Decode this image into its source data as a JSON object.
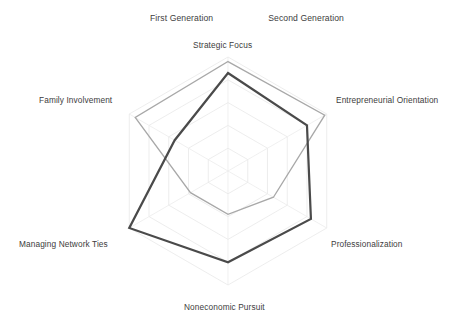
{
  "legend": {
    "position": "top-center",
    "items": [
      {
        "label": "First Generation",
        "color": "#a8a8a8",
        "width": 1.3
      },
      {
        "label": "Second Generation",
        "color": "#4a4a4a",
        "width": 2.2
      }
    ]
  },
  "axis_labels": {
    "strategic_focus": "Strategic Focus",
    "entrepreneurial_orientation": "Entrepreneurial Orientation",
    "professionalization": "Professionalization",
    "noneconomic_pursuit": "Noneconomic Pursuit",
    "managing_network_ties": "Managing Network Ties",
    "family_involvement": "Family Involvement"
  },
  "chart_data": {
    "type": "radar",
    "title": "",
    "xlabel": "",
    "ylabel": "",
    "categories": [
      "Strategic Focus",
      "Entrepreneurial Orientation",
      "Professionalization",
      "Noneconomic Pursuit",
      "Managing Network Ties",
      "Family Involvement"
    ],
    "series": [
      {
        "name": "First Generation",
        "color": "#a8a8a8",
        "line_width": 1.3,
        "values": [
          4.8,
          4.9,
          2.3,
          1.9,
          1.9,
          4.7
        ]
      },
      {
        "name": "Second Generation",
        "color": "#4a4a4a",
        "line_width": 2.2,
        "values": [
          4.3,
          4.0,
          4.2,
          4.0,
          5.0,
          2.7
        ]
      }
    ],
    "rlim": [
      0,
      5
    ],
    "grid": true,
    "grid_rings": 5,
    "grid_shape": "hexagon",
    "grid_color": "#e9e9e9",
    "legend_position": "top-center",
    "tick_labels": []
  },
  "geometry": {
    "center_x": 228,
    "center_y": 171,
    "outer_radius": 114,
    "start_angle_deg": -90
  }
}
